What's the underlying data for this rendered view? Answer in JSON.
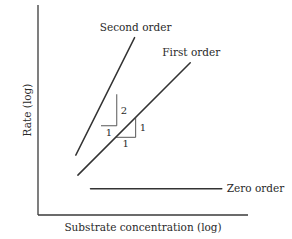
{
  "chart_data": {
    "type": "line",
    "title": "",
    "xlabel": "Substrate concentration (log)",
    "ylabel": "Rate (log)",
    "xlim": [
      0,
      10
    ],
    "ylim": [
      0,
      10
    ],
    "grid": false,
    "axis_ticks": false,
    "colors": {
      "line": "#333333",
      "axis": "#3a3a3a",
      "text": "#2a2a2a"
    },
    "series": [
      {
        "name": "Second order",
        "x": [
          1.8,
          4.6
        ],
        "y": [
          2.85,
          8.45
        ],
        "slope": 2
      },
      {
        "name": "First order",
        "x": [
          1.9,
          7.25
        ],
        "y": [
          1.9,
          7.25
        ],
        "slope": 1
      },
      {
        "name": "Zero order",
        "x": [
          2.5,
          8.75
        ],
        "y": [
          1.25,
          1.25
        ],
        "slope": 0
      }
    ],
    "slope_triangles": [
      {
        "series": "Second order",
        "x0": 3.0,
        "y0": 4.25,
        "run": 0.75,
        "rise": 1.5,
        "run_label": "1",
        "rise_label": "2"
      },
      {
        "series": "First order",
        "x0": 3.7,
        "y0": 3.7,
        "run": 0.95,
        "rise": 0.95,
        "run_label": "1",
        "rise_label": "1"
      }
    ]
  }
}
